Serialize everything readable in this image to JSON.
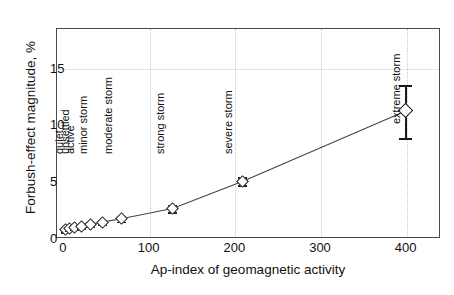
{
  "chart_data": {
    "type": "scatter",
    "title": "",
    "xlabel": "Ap-index of geomagnetic activity",
    "ylabel": "Forbush-effect magnitude, %",
    "xlim": [
      -8,
      440
    ],
    "ylim": [
      0,
      18.5
    ],
    "xticks": [
      0,
      100,
      200,
      300,
      400
    ],
    "yticks": [
      0,
      5,
      10,
      15
    ],
    "xtick_labels": [
      "0",
      "100",
      "200",
      "300",
      "400"
    ],
    "ytick_labels": [
      "0",
      "5",
      "10",
      "15"
    ],
    "grid": "light vertical gridlines at x ticks, faint horizontal line near y=15",
    "legend": "none",
    "marker_style": "open diamond",
    "series": [
      {
        "name": "Forbush-effect magnitude vs Ap-index",
        "x": [
          3,
          8,
          14,
          22,
          32,
          46,
          68,
          128,
          210,
          400
        ],
        "y": [
          0.75,
          0.85,
          0.95,
          1.05,
          1.2,
          1.4,
          1.7,
          2.6,
          5.0,
          11.2
        ],
        "yerr_low": [
          0.2,
          0.2,
          0.2,
          0.2,
          0.2,
          0.2,
          0.25,
          0.3,
          0.35,
          2.4
        ],
        "yerr_high": [
          0.2,
          0.2,
          0.2,
          0.2,
          0.2,
          0.2,
          0.25,
          0.3,
          0.35,
          2.3
        ],
        "connected": true
      }
    ],
    "annotations": [
      {
        "text": "quiet",
        "x": 3,
        "rotation": -90
      },
      {
        "text": "unsettled",
        "x": 9,
        "rotation": -90
      },
      {
        "text": "active",
        "x": 15,
        "rotation": -90
      },
      {
        "text": "minor storm",
        "x": 30,
        "rotation": -90
      },
      {
        "text": "moderate storm",
        "x": 60,
        "rotation": -90
      },
      {
        "text": "strong storm",
        "x": 120,
        "rotation": -90
      },
      {
        "text": "severe storm",
        "x": 200,
        "rotation": -90
      },
      {
        "text": "extreme storm",
        "x": 396,
        "rotation": -90
      }
    ]
  }
}
